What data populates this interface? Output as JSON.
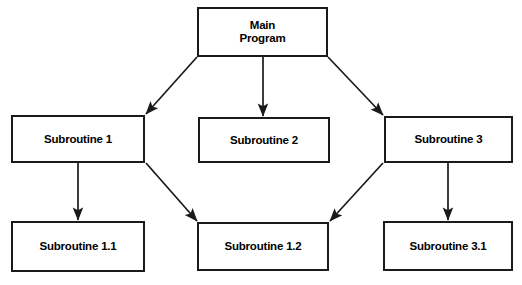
{
  "diagram": {
    "type": "hierarchy-flowchart",
    "title": "",
    "canvas": {
      "width": 522,
      "height": 285,
      "background": "#ffffff"
    },
    "style": {
      "box_border_color": "#1a1a1a",
      "box_fill_color": "#ffffff",
      "arrow_color": "#1a1a1a",
      "text_color": "#000000"
    },
    "nodes": [
      {
        "id": "main",
        "label": "Main\nProgram",
        "x": 197,
        "y": 7,
        "width": 131,
        "height": 50
      },
      {
        "id": "sub1",
        "label": "Subroutine 1",
        "x": 11,
        "y": 115,
        "width": 134,
        "height": 48
      },
      {
        "id": "sub2",
        "label": "Subroutine 2",
        "x": 198,
        "y": 117,
        "width": 132,
        "height": 46
      },
      {
        "id": "sub3",
        "label": "Subroutine 3",
        "x": 384,
        "y": 116,
        "width": 129,
        "height": 47
      },
      {
        "id": "sub11",
        "label": "Subroutine 1.1",
        "x": 11,
        "y": 221,
        "width": 134,
        "height": 51
      },
      {
        "id": "sub12",
        "label": "Subroutine 1.2",
        "x": 197,
        "y": 222,
        "width": 132,
        "height": 49
      },
      {
        "id": "sub31",
        "label": "Subroutine 3.1",
        "x": 383,
        "y": 221,
        "width": 130,
        "height": 50
      }
    ],
    "edges": [
      {
        "id": "main-to-sub1",
        "from": "main",
        "to": "sub1",
        "x1": 197,
        "y1": 57,
        "x2": 146,
        "y2": 114,
        "kind": "diagonal"
      },
      {
        "id": "main-to-sub2",
        "from": "main",
        "to": "sub2",
        "x1": 263,
        "y1": 57,
        "x2": 263,
        "y2": 116,
        "kind": "vertical"
      },
      {
        "id": "main-to-sub3",
        "from": "main",
        "to": "sub3",
        "x1": 328,
        "y1": 57,
        "x2": 383,
        "y2": 115,
        "kind": "diagonal"
      },
      {
        "id": "sub1-to-sub11",
        "from": "sub1",
        "to": "sub11",
        "x1": 78,
        "y1": 163,
        "x2": 78,
        "y2": 220,
        "kind": "vertical"
      },
      {
        "id": "sub1-to-sub12",
        "from": "sub1",
        "to": "sub12",
        "x1": 146,
        "y1": 163,
        "x2": 197,
        "y2": 221,
        "kind": "diagonal"
      },
      {
        "id": "sub3-to-sub12",
        "from": "sub3",
        "to": "sub12",
        "x1": 383,
        "y1": 163,
        "x2": 330,
        "y2": 221,
        "kind": "diagonal"
      },
      {
        "id": "sub3-to-sub31",
        "from": "sub3",
        "to": "sub31",
        "x1": 448,
        "y1": 163,
        "x2": 448,
        "y2": 220,
        "kind": "vertical"
      }
    ]
  }
}
